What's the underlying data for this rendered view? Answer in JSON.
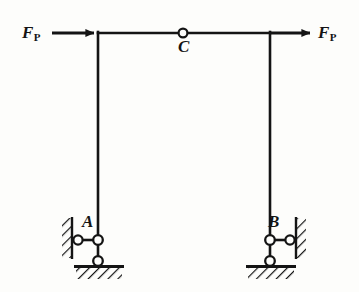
{
  "figure": {
    "kind": "structural-mechanics-diagram",
    "background_color": "#fdfdfb",
    "line_color": "#141414"
  },
  "labels": {
    "force_left": {
      "symbol": "F",
      "subscript": "P"
    },
    "force_right": {
      "symbol": "F",
      "subscript": "P"
    },
    "hinge_c": "C",
    "support_a": "A",
    "support_b": "B"
  },
  "geometry": {
    "beam": {
      "x1": 98,
      "y1": 33,
      "x2": 270,
      "y2": 33
    },
    "column_left": {
      "x": 98,
      "y_top": 33,
      "y_bottom": 240
    },
    "column_right": {
      "x": 270,
      "y_top": 33,
      "y_bottom": 240
    },
    "hinge_c": {
      "cx": 183,
      "cy": 33,
      "r": 4.5
    },
    "support_a": {
      "pin_main": {
        "cx": 98,
        "cy": 240,
        "r": 5
      },
      "pin_wall": {
        "cx": 78,
        "cy": 240,
        "r": 5
      },
      "pin_ground": {
        "cx": 98,
        "cy": 261,
        "r": 5
      },
      "wall_x": 72,
      "wall_y_top": 218,
      "wall_y_bottom": 258,
      "ground_y": 268,
      "ground_x1": 76,
      "ground_x2": 122
    },
    "support_b": {
      "pin_main": {
        "cx": 270,
        "cy": 240,
        "r": 5
      },
      "pin_wall": {
        "cx": 290,
        "cy": 240,
        "r": 5
      },
      "pin_ground": {
        "cx": 270,
        "cy": 261,
        "r": 5
      },
      "wall_x": 296,
      "wall_y_top": 218,
      "wall_y_bottom": 258,
      "ground_y": 268,
      "ground_x1": 248,
      "ground_x2": 294
    },
    "arrow_left": {
      "x_tail": 52,
      "x_head": 98,
      "y": 33
    },
    "arrow_right": {
      "x_tail": 270,
      "x_head": 314,
      "y": 33
    }
  }
}
